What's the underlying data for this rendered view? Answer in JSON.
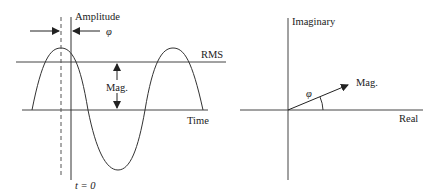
{
  "waveform": {
    "labels": {
      "amplitude": "Amplitude",
      "phase": "φ",
      "rms": "RMS",
      "magnitude": "Mag.",
      "time": "Time",
      "t_zero": "t = 0"
    }
  },
  "phasor": {
    "labels": {
      "imaginary": "Imaginary",
      "real": "Real",
      "magnitude": "Mag.",
      "phase": "φ"
    }
  },
  "colors": {
    "stroke": "#333333",
    "text": "#222222",
    "background": "#ffffff"
  }
}
